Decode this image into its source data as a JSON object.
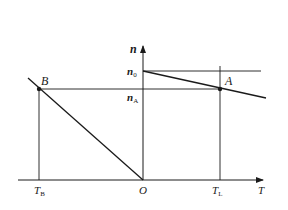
{
  "diagram": {
    "axes": {
      "x_label": "T",
      "y_label": "n",
      "origin_label": "O"
    },
    "points": [
      {
        "name": "B",
        "label": "B"
      },
      {
        "name": "A",
        "label": "A"
      }
    ],
    "y_ticks": [
      {
        "base": "n",
        "sub": "0"
      },
      {
        "base": "n",
        "sub": "A"
      }
    ],
    "x_ticks": [
      {
        "base": "T",
        "sub": "B"
      },
      {
        "base": "T",
        "sub": "L"
      }
    ],
    "colors": {
      "line": "#1a1a1a",
      "background": "#ffffff"
    }
  }
}
